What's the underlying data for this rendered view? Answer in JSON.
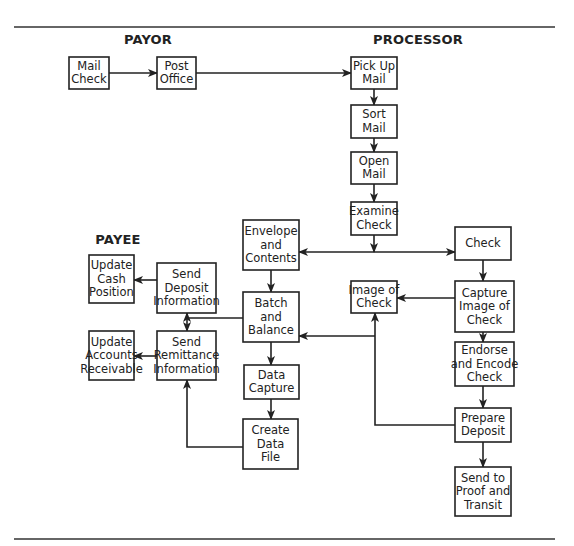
{
  "diagram": {
    "type": "flowchart",
    "sections": [
      {
        "id": "payor",
        "label": "PAYOR",
        "x": 148,
        "y": 44
      },
      {
        "id": "processor",
        "label": "PROCESSOR",
        "x": 418,
        "y": 44
      },
      {
        "id": "payee",
        "label": "PAYEE",
        "x": 118,
        "y": 244
      }
    ],
    "nodes": [
      {
        "id": "mail-check",
        "lines": [
          "Mail",
          "Check"
        ],
        "x": 69,
        "y": 57,
        "w": 40,
        "h": 32
      },
      {
        "id": "post-office",
        "lines": [
          "Post",
          "Office"
        ],
        "x": 157,
        "y": 57,
        "w": 39,
        "h": 32
      },
      {
        "id": "pick-up-mail",
        "lines": [
          "Pick Up",
          "Mail"
        ],
        "x": 351,
        "y": 57,
        "w": 46,
        "h": 32
      },
      {
        "id": "sort-mail",
        "lines": [
          "Sort",
          "Mail"
        ],
        "x": 351,
        "y": 105,
        "w": 46,
        "h": 33
      },
      {
        "id": "open-mail",
        "lines": [
          "Open",
          "Mail"
        ],
        "x": 351,
        "y": 152,
        "w": 46,
        "h": 32
      },
      {
        "id": "examine-check",
        "lines": [
          "Examine",
          "Check"
        ],
        "x": 351,
        "y": 202,
        "w": 46,
        "h": 33
      },
      {
        "id": "envelope-and-contents",
        "lines": [
          "Envelope",
          "and",
          "Contents"
        ],
        "x": 243,
        "y": 220,
        "w": 56,
        "h": 50
      },
      {
        "id": "check",
        "lines": [
          "Check"
        ],
        "x": 455,
        "y": 227,
        "w": 56,
        "h": 33
      },
      {
        "id": "send-deposit-information",
        "lines": [
          "Send",
          "Deposit",
          "Information"
        ],
        "x": 157,
        "y": 263,
        "w": 59,
        "h": 50
      },
      {
        "id": "update-cash-position",
        "lines": [
          "Update",
          "Cash",
          "Position"
        ],
        "x": 89,
        "y": 255,
        "w": 45,
        "h": 48
      },
      {
        "id": "batch-and-balance",
        "lines": [
          "Batch",
          "and",
          "Balance"
        ],
        "x": 243,
        "y": 292,
        "w": 56,
        "h": 50
      },
      {
        "id": "image-of-check",
        "lines": [
          "Image of",
          "Check"
        ],
        "x": 351,
        "y": 281,
        "w": 46,
        "h": 32
      },
      {
        "id": "capture-image-of-check",
        "lines": [
          "Capture",
          "Image of",
          "Check"
        ],
        "x": 455,
        "y": 281,
        "w": 59,
        "h": 51
      },
      {
        "id": "send-remittance-information",
        "lines": [
          "Send",
          "Remittance",
          "Information"
        ],
        "x": 157,
        "y": 331,
        "w": 59,
        "h": 49
      },
      {
        "id": "update-accounts-receivable",
        "lines": [
          "Update",
          "Accounts",
          "Receivable"
        ],
        "x": 89,
        "y": 331,
        "w": 45,
        "h": 49
      },
      {
        "id": "endorse-and-encode-check",
        "lines": [
          "Endorse",
          "and Encode",
          "Check"
        ],
        "x": 455,
        "y": 342,
        "w": 59,
        "h": 44
      },
      {
        "id": "data-capture",
        "lines": [
          "Data",
          "Capture"
        ],
        "x": 244,
        "y": 365,
        "w": 55,
        "h": 34
      },
      {
        "id": "prepare-deposit",
        "lines": [
          "Prepare",
          "Deposit"
        ],
        "x": 455,
        "y": 408,
        "w": 56,
        "h": 34
      },
      {
        "id": "create-data-file",
        "lines": [
          "Create",
          "Data",
          "File"
        ],
        "x": 243,
        "y": 419,
        "w": 55,
        "h": 50
      },
      {
        "id": "send-to-proof-and-transit",
        "lines": [
          "Send to",
          "Proof and",
          "Transit"
        ],
        "x": 455,
        "y": 467,
        "w": 56,
        "h": 49
      }
    ],
    "edges": [
      {
        "from": "mail-check",
        "to": "post-office",
        "points": [
          [
            109,
            73
          ],
          [
            157,
            73
          ]
        ],
        "arrow_end": true
      },
      {
        "from": "post-office",
        "to": "pick-up-mail",
        "points": [
          [
            196,
            73
          ],
          [
            351,
            73
          ]
        ],
        "arrow_end": true
      },
      {
        "from": "pick-up-mail",
        "to": "sort-mail",
        "points": [
          [
            374,
            89
          ],
          [
            374,
            105
          ]
        ],
        "arrow_end": true
      },
      {
        "from": "sort-mail",
        "to": "open-mail",
        "points": [
          [
            374,
            138
          ],
          [
            374,
            152
          ]
        ],
        "arrow_end": true
      },
      {
        "from": "open-mail",
        "to": "examine-check",
        "points": [
          [
            374,
            184
          ],
          [
            374,
            202
          ]
        ],
        "arrow_end": true
      },
      {
        "from": "examine-check",
        "to": "junction",
        "points": [
          [
            374,
            235
          ],
          [
            374,
            252
          ]
        ],
        "arrow_end": true
      },
      {
        "from": "junction",
        "to": "envelope-and-contents",
        "points": [
          [
            374,
            252
          ],
          [
            299,
            252
          ]
        ],
        "arrow_end": true
      },
      {
        "from": "junction",
        "to": "check",
        "points": [
          [
            374,
            252
          ],
          [
            455,
            252
          ]
        ],
        "arrow_end": true
      },
      {
        "from": "envelope-and-contents",
        "to": "batch-and-balance",
        "points": [
          [
            271,
            270
          ],
          [
            271,
            292
          ]
        ],
        "arrow_end": true
      },
      {
        "from": "check",
        "to": "capture-image-of-check",
        "points": [
          [
            483,
            260
          ],
          [
            483,
            281
          ]
        ],
        "arrow_end": true
      },
      {
        "from": "capture-image-of-check",
        "to": "image-of-check",
        "points": [
          [
            455,
            298
          ],
          [
            397,
            298
          ]
        ],
        "arrow_end": true
      },
      {
        "from": "capture-image-of-check",
        "to": "endorse-and-encode-check",
        "points": [
          [
            483,
            332
          ],
          [
            483,
            342
          ]
        ],
        "arrow_end": true
      },
      {
        "from": "endorse-and-encode-check",
        "to": "prepare-deposit",
        "points": [
          [
            483,
            386
          ],
          [
            483,
            408
          ]
        ],
        "arrow_end": true
      },
      {
        "from": "prepare-deposit",
        "to": "send-to-proof-and-transit",
        "points": [
          [
            483,
            442
          ],
          [
            483,
            467
          ]
        ],
        "arrow_end": true
      },
      {
        "from": "prepare-deposit",
        "to": "image-of-check",
        "points": [
          [
            455,
            425
          ],
          [
            375,
            425
          ],
          [
            375,
            313
          ]
        ],
        "arrow_end": true
      },
      {
        "from": "image-of-check-branch",
        "to": "batch-and-balance",
        "points": [
          [
            375,
            336
          ],
          [
            299,
            336
          ]
        ],
        "arrow_end": true
      },
      {
        "from": "batch-and-balance",
        "to": "send-deposit-remittance-link",
        "points": [
          [
            243,
            318
          ],
          [
            187,
            318
          ]
        ],
        "arrow_end": false
      },
      {
        "from": "send-deposit-remittance-link",
        "to": "send-deposit-information",
        "points": [
          [
            187,
            318
          ],
          [
            187,
            313
          ]
        ],
        "arrow_end": true
      },
      {
        "from": "send-deposit-remittance-link",
        "to": "send-remittance-information",
        "points": [
          [
            187,
            318
          ],
          [
            187,
            331
          ]
        ],
        "arrow_end": true
      },
      {
        "from": "send-deposit-information",
        "to": "update-cash-position",
        "points": [
          [
            157,
            280
          ],
          [
            134,
            280
          ]
        ],
        "arrow_end": true
      },
      {
        "from": "send-remittance-information",
        "to": "update-accounts-receivable",
        "points": [
          [
            157,
            356
          ],
          [
            134,
            356
          ]
        ],
        "arrow_end": true
      },
      {
        "from": "batch-and-balance",
        "to": "data-capture",
        "points": [
          [
            271,
            342
          ],
          [
            271,
            365
          ]
        ],
        "arrow_end": true
      },
      {
        "from": "data-capture",
        "to": "create-data-file",
        "points": [
          [
            271,
            399
          ],
          [
            271,
            419
          ]
        ],
        "arrow_end": true
      },
      {
        "from": "create-data-file",
        "to": "send-remittance-information",
        "points": [
          [
            243,
            447
          ],
          [
            187,
            447
          ],
          [
            187,
            380
          ]
        ],
        "arrow_end": true
      }
    ],
    "rules": [
      {
        "id": "top-rule",
        "x1": 14,
        "y1": 27,
        "x2": 555,
        "y2": 27
      },
      {
        "id": "bottom-rule",
        "x1": 14,
        "y1": 539,
        "x2": 555,
        "y2": 539
      }
    ]
  }
}
